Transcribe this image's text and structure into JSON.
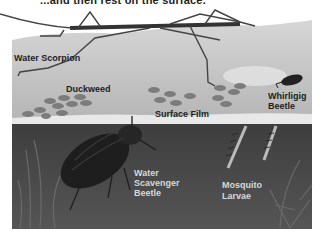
{
  "caption": {
    "text": "...and then rest on the surface."
  },
  "illustration": {
    "colors": {
      "background": "#ffffff",
      "surface_layer": "#c8c8c8",
      "surface_highlight": "#e6e6e6",
      "underwater": "#4a4a4a",
      "duckweed": "#7a7a7a",
      "insect_dark": "#2a2a2a"
    },
    "labels": {
      "water_scorpion": "Water Scorpion",
      "duckweed": "Duckweed",
      "surface_film": "Surface Film",
      "whirligig_line1": "Whirligig",
      "whirligig_line2": "Beetle",
      "scavenger_line1": "Water",
      "scavenger_line2": "Scavenger",
      "scavenger_line3": "Beetle",
      "mosquito_line1": "Mosquito",
      "mosquito_line2": "Larvae"
    }
  }
}
